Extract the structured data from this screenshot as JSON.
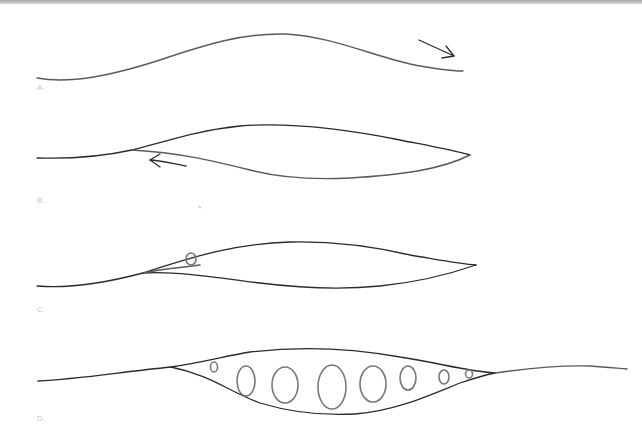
{
  "figure": {
    "panels": [
      {
        "id": "A",
        "label": "A.",
        "description": "single wavy line with arrow pointing right"
      },
      {
        "id": "B",
        "label": "B.",
        "description": "line splits into a lens-shaped gap; arrow pointing left"
      },
      {
        "id": "C",
        "label": "C.",
        "description": "lens-shaped gap with a small loop near the left split"
      },
      {
        "id": "D",
        "label": "D.",
        "description": "lens-shaped gap filled with a series of loops of increasing then decreasing size"
      }
    ],
    "colors": {
      "line": "#2b2b2b",
      "loop": "#777777",
      "label": "#c4c4c4",
      "background": "#ffffff"
    }
  }
}
